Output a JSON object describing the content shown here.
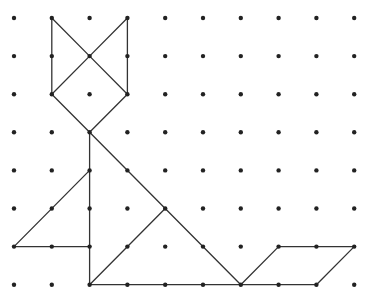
{
  "diagram": {
    "type": "dot-grid tangram figure (cat)",
    "grid": {
      "columns": 10,
      "rows": 8,
      "origin_x": 14,
      "origin_y": 18,
      "spacing_x": 37.8,
      "spacing_y": 38.1,
      "dot_radius": 2.2,
      "dot_color": "#222222"
    },
    "line_color": "#333333",
    "segments": [
      {
        "name": "left-ear-outer",
        "from": [
          1,
          0
        ],
        "to": [
          1,
          2
        ]
      },
      {
        "name": "left-ear-inner",
        "from": [
          1,
          0
        ],
        "to": [
          2,
          1
        ]
      },
      {
        "name": "right-ear-inner",
        "from": [
          3,
          0
        ],
        "to": [
          2,
          1
        ]
      },
      {
        "name": "right-ear-outer",
        "from": [
          3,
          0
        ],
        "to": [
          3,
          2
        ]
      },
      {
        "name": "head-upper-left",
        "from": [
          2,
          1
        ],
        "to": [
          1,
          2
        ]
      },
      {
        "name": "head-upper-right",
        "from": [
          2,
          1
        ],
        "to": [
          3,
          2
        ]
      },
      {
        "name": "head-lower-left",
        "from": [
          1,
          2
        ],
        "to": [
          2,
          3
        ]
      },
      {
        "name": "head-lower-right",
        "from": [
          3,
          2
        ],
        "to": [
          2,
          3
        ]
      },
      {
        "name": "body-vertical",
        "from": [
          2,
          3
        ],
        "to": [
          2,
          7
        ]
      },
      {
        "name": "body-diagonal",
        "from": [
          2,
          3
        ],
        "to": [
          6,
          7
        ]
      },
      {
        "name": "paw-diagonal",
        "from": [
          0,
          6
        ],
        "to": [
          2,
          4
        ]
      },
      {
        "name": "paw-base",
        "from": [
          0,
          6
        ],
        "to": [
          2,
          6
        ]
      },
      {
        "name": "body-inner-diagonal",
        "from": [
          2,
          7
        ],
        "to": [
          4,
          5
        ]
      },
      {
        "name": "base-line",
        "from": [
          2,
          7
        ],
        "to": [
          8,
          7
        ]
      },
      {
        "name": "tail-left",
        "from": [
          6,
          7
        ],
        "to": [
          7,
          6
        ]
      },
      {
        "name": "tail-top",
        "from": [
          7,
          6
        ],
        "to": [
          9,
          6
        ]
      },
      {
        "name": "tail-right",
        "from": [
          9,
          6
        ],
        "to": [
          8,
          7
        ]
      }
    ]
  }
}
